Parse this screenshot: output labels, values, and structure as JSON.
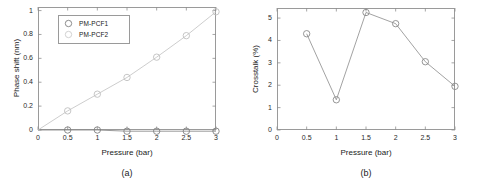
{
  "figure": {
    "panels": [
      {
        "caption": "(a)",
        "xlabel": "Pressure (bar)",
        "ylabel": "Phase shift (nm)",
        "xticks": [
          "0",
          "0.5",
          "1",
          "1.5",
          "2",
          "2.5",
          "3"
        ],
        "yticks": [
          "0",
          "0.2",
          "0.4",
          "0.6",
          "0.8",
          "1"
        ],
        "legend": [
          {
            "label": "PM-PCF1",
            "color": "#808080"
          },
          {
            "label": "PM-PCF2",
            "color": "#c8c8c8"
          }
        ]
      },
      {
        "caption": "(b)",
        "xlabel": "Pressure (bar)",
        "ylabel": "Crosstalk (%)",
        "xticks": [
          "0",
          "0.5",
          "1",
          "1.5",
          "2",
          "2.5",
          "3"
        ],
        "yticks": [
          "0",
          "1",
          "2",
          "3",
          "4",
          "5"
        ]
      }
    ]
  },
  "chart_data": [
    {
      "type": "line",
      "title": "",
      "panel_label": "(a)",
      "xlabel": "Pressure (bar)",
      "ylabel": "Phase shift (nm)",
      "xlim": [
        0,
        3
      ],
      "ylim": [
        0,
        1.03
      ],
      "xticks": [
        0,
        0.5,
        1,
        1.5,
        2,
        2.5,
        3
      ],
      "yticks": [
        0,
        0.2,
        0.4,
        0.6,
        0.8,
        1
      ],
      "grid": false,
      "legend_position": "upper left",
      "x": [
        0.5,
        1,
        1.5,
        2,
        2.5,
        3
      ],
      "series": [
        {
          "name": "PM-PCF1",
          "values": [
            0.0,
            0.0,
            -0.01,
            -0.01,
            -0.01,
            -0.01
          ],
          "marker": "circle",
          "color": "#808080"
        },
        {
          "name": "PM-PCF2",
          "values": [
            0.16,
            0.3,
            0.44,
            0.61,
            0.79,
            0.99
          ],
          "marker": "circle",
          "color": "#c0c0c0"
        }
      ]
    },
    {
      "type": "line",
      "title": "",
      "panel_label": "(b)",
      "xlabel": "Pressure (bar)",
      "ylabel": "Crosstalk (%)",
      "xlim": [
        0,
        3
      ],
      "ylim": [
        0,
        5.45
      ],
      "xticks": [
        0,
        0.5,
        1,
        1.5,
        2,
        2.5,
        3
      ],
      "yticks": [
        0,
        1,
        2,
        3,
        4,
        5
      ],
      "grid": false,
      "legend_position": "none",
      "x": [
        0.5,
        1,
        1.5,
        2,
        2.5,
        3
      ],
      "series": [
        {
          "name": "Crosstalk",
          "values": [
            4.3,
            1.35,
            5.25,
            4.75,
            3.05,
            1.95
          ],
          "marker": "circle",
          "color": "#8a8a8a"
        }
      ]
    }
  ]
}
